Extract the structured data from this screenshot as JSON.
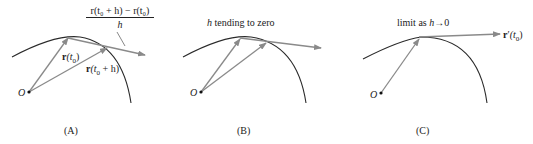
{
  "colors": {
    "curve": "#2a2a2a",
    "vector": "#8a8a8a",
    "text": "#222222",
    "origin_dot": "#111111"
  },
  "panels": [
    {
      "id": "A",
      "caption": "(A)",
      "origin_label": "O",
      "vector_labels": {
        "r_t0": {
          "bold": "r",
          "rest": "(t",
          "sub": "0",
          "close": ")"
        },
        "r_t0_h": {
          "bold": "r",
          "rest": "(t",
          "sub": "0",
          "tail": " + h)"
        }
      },
      "difference_quotient": {
        "numerator": "r(t₀ + h) − r(t₀)",
        "denominator": "h"
      }
    },
    {
      "id": "B",
      "caption": "(B)",
      "origin_label": "O",
      "title": {
        "italic": "h",
        "rest": " tending to zero"
      }
    },
    {
      "id": "C",
      "caption": "(C)",
      "origin_label": "O",
      "title": {
        "prefix": "limit as ",
        "italic": "h",
        "rest": "→0"
      },
      "derivative_label": {
        "bold": "r",
        "prime": "′",
        "rest": "(t",
        "sub": "0",
        "close": ")"
      }
    }
  ]
}
